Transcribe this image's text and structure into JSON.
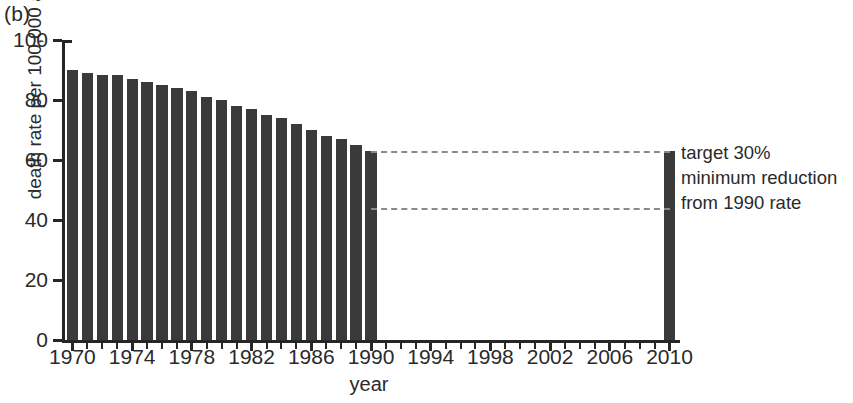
{
  "panel": {
    "label": "(b)"
  },
  "annotation": {
    "line1": "target 30%",
    "line2": "minimum reduction",
    "line3": "from 1990 rate"
  },
  "colors": {
    "bar": "#3a3a3a",
    "axis": "#262626",
    "dashed_line": "#8a8a8a",
    "text": "#2a2a2a",
    "background": "#ffffff"
  },
  "chart_data": {
    "type": "bar",
    "title": "",
    "subtitle": "",
    "xlabel": "year",
    "ylabel": "death rate per 100,000 adult males",
    "xlim": [
      1969.3,
      2010.7
    ],
    "ylim": [
      0,
      100
    ],
    "yticks": [
      0,
      20,
      40,
      60,
      80,
      100
    ],
    "ytick_labels": [
      "0",
      "20",
      "40",
      "60",
      "80",
      "100"
    ],
    "xticks": [
      1970,
      1971,
      1972,
      1973,
      1974,
      1975,
      1976,
      1977,
      1978,
      1979,
      1980,
      1981,
      1982,
      1983,
      1984,
      1985,
      1986,
      1987,
      1988,
      1989,
      1990,
      1991,
      1992,
      1993,
      1994,
      1995,
      1996,
      1997,
      1998,
      1999,
      2000,
      2001,
      2002,
      2003,
      2004,
      2005,
      2006,
      2007,
      2008,
      2009,
      2010
    ],
    "xtick_labels_major": [
      "1970",
      "1974",
      "1978",
      "1982",
      "1986",
      "1990",
      "1994",
      "1998",
      "2002",
      "2006",
      "2010"
    ],
    "xticks_major": [
      1970,
      1974,
      1978,
      1982,
      1986,
      1990,
      1994,
      1998,
      2002,
      2006,
      2010
    ],
    "grid": false,
    "legend": null,
    "categories": [
      1970,
      1971,
      1972,
      1973,
      1974,
      1975,
      1976,
      1977,
      1978,
      1979,
      1980,
      1981,
      1982,
      1983,
      1984,
      1985,
      1986,
      1987,
      1988,
      1989,
      1990,
      2010
    ],
    "values": [
      90,
      89,
      88.5,
      88.5,
      87,
      86,
      85,
      84,
      83,
      81,
      80,
      78,
      77,
      75,
      74,
      72,
      70,
      68,
      67,
      65,
      63,
      63
    ],
    "annotations": [
      {
        "kind": "dashed-line",
        "y": 63,
        "x_from": 1990,
        "x_to": 2010,
        "note": "1990 rate reference"
      },
      {
        "kind": "dashed-line",
        "y": 44,
        "x_from": 1990,
        "x_to": 2010,
        "note": "30% below 1990 rate"
      },
      {
        "kind": "text",
        "x": 2011,
        "y": 60,
        "text": "target 30% minimum reduction from 1990 rate"
      }
    ]
  }
}
